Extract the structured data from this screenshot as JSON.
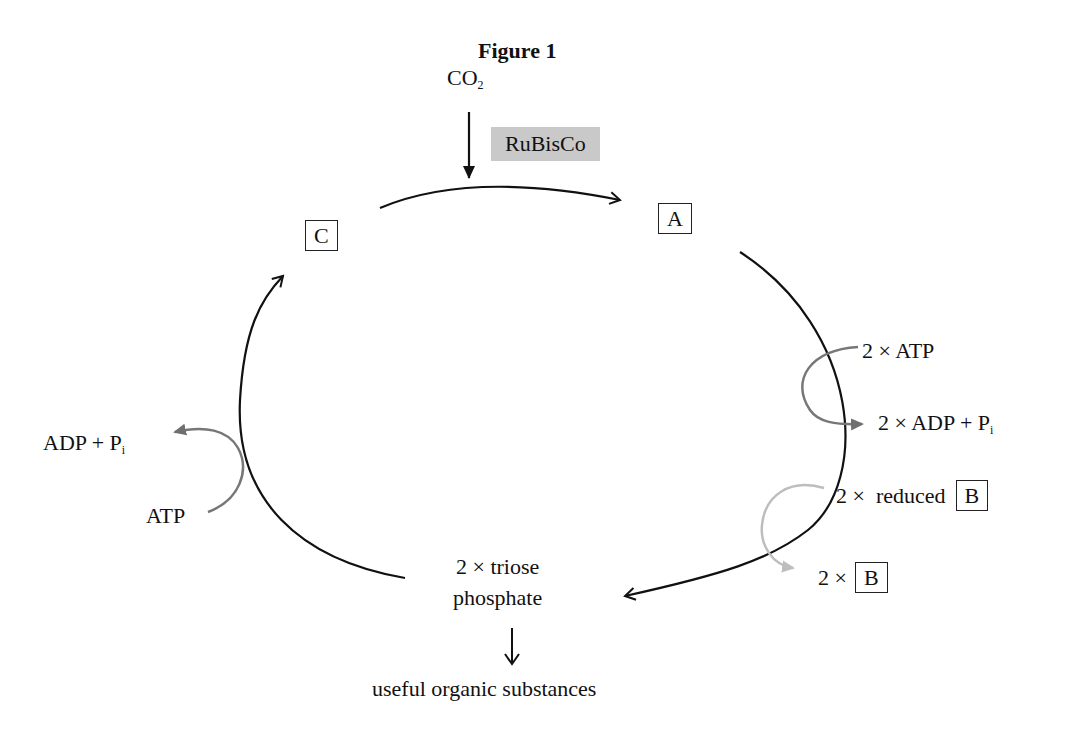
{
  "figure": {
    "title": "Figure 1",
    "input": {
      "label": "CO",
      "subscript": "2"
    },
    "enzyme": {
      "label": "RuBisCo",
      "highlight_color": "#c9c9c9"
    },
    "compounds": {
      "A": "A",
      "B": "B",
      "C": "C"
    },
    "right_side": {
      "atp_in": "2 × ATP",
      "adp_out": "2 × ADP + P",
      "adp_out_sub": "i",
      "reduced_b_prefix": "2 ×  reduced",
      "b_out_prefix": "2 ×"
    },
    "left_side": {
      "adp_out": "ADP + P",
      "adp_out_sub": "i",
      "atp_in": "ATP"
    },
    "bottom": {
      "product_line1": "2 × triose",
      "product_line2": "phosphate",
      "output": "useful organic substances"
    },
    "colors": {
      "cycle_arrow": "#111111",
      "atp_arrow": "#777777",
      "nadph_arrow": "#bbbbbb"
    }
  }
}
